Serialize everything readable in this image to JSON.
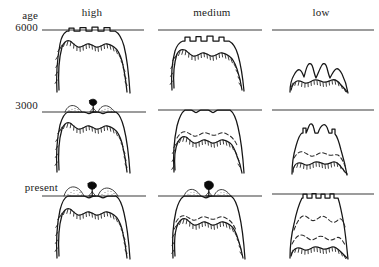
{
  "figure": {
    "type": "matrix-of-cross-sections",
    "axis_label": "age",
    "columns": [
      {
        "id": "high",
        "label": "high"
      },
      {
        "id": "medium",
        "label": "medium"
      },
      {
        "id": "low",
        "label": "low"
      }
    ],
    "rows": [
      {
        "id": "6000",
        "label": "6000"
      },
      {
        "id": "3000",
        "label": "3000"
      },
      {
        "id": "present",
        "label": "present"
      }
    ],
    "colors": {
      "background": "#ffffff",
      "ink": "#161616",
      "reference_line": "#3a3a3a",
      "dashed_line": "#2b2b2b",
      "tree_marker": "#0a0a0a"
    },
    "legend_notes": {
      "reference_line": "horizontal datum line",
      "solid_outline": "landform surface profile",
      "dashed_outline": "former surface position",
      "stippled_band": "eroded / weathered mantle",
      "tree_marker": "treeline position marker"
    },
    "cells": [
      {
        "id": "high-6000",
        "column": "high",
        "row": "6000",
        "summit_reaches_datum": true,
        "dashed_lines": 0,
        "has_tree_marker": false,
        "relief": 1.0,
        "summit_notches": 5
      },
      {
        "id": "medium-6000",
        "column": "medium",
        "row": "6000",
        "summit_reaches_datum": false,
        "dashed_lines": 0,
        "has_tree_marker": false,
        "relief": 0.82,
        "summit_notches": 5
      },
      {
        "id": "low-6000",
        "column": "low",
        "row": "6000",
        "summit_reaches_datum": false,
        "dashed_lines": 0,
        "has_tree_marker": false,
        "relief": 0.44,
        "summit_notches": 4
      },
      {
        "id": "high-3000",
        "column": "high",
        "row": "3000",
        "summit_reaches_datum": true,
        "dashed_lines": 0,
        "has_tree_marker": true,
        "relief": 0.96,
        "summit_notches": 4
      },
      {
        "id": "medium-3000",
        "column": "medium",
        "row": "3000",
        "summit_reaches_datum": true,
        "dashed_lines": 1,
        "has_tree_marker": false,
        "relief": 0.9,
        "summit_notches": 3
      },
      {
        "id": "low-3000",
        "column": "low",
        "row": "3000",
        "summit_reaches_datum": false,
        "dashed_lines": 1,
        "has_tree_marker": false,
        "relief": 0.62,
        "summit_notches": 4
      },
      {
        "id": "high-present",
        "column": "high",
        "row": "present",
        "summit_reaches_datum": true,
        "dashed_lines": 0,
        "has_tree_marker": true,
        "relief": 0.96,
        "summit_notches": 4
      },
      {
        "id": "medium-present",
        "column": "medium",
        "row": "present",
        "summit_reaches_datum": true,
        "dashed_lines": 1,
        "has_tree_marker": true,
        "relief": 0.92,
        "summit_notches": 3
      },
      {
        "id": "low-present",
        "column": "low",
        "row": "present",
        "summit_reaches_datum": true,
        "dashed_lines": 2,
        "has_tree_marker": false,
        "relief": 0.88,
        "summit_notches": 5
      }
    ]
  }
}
